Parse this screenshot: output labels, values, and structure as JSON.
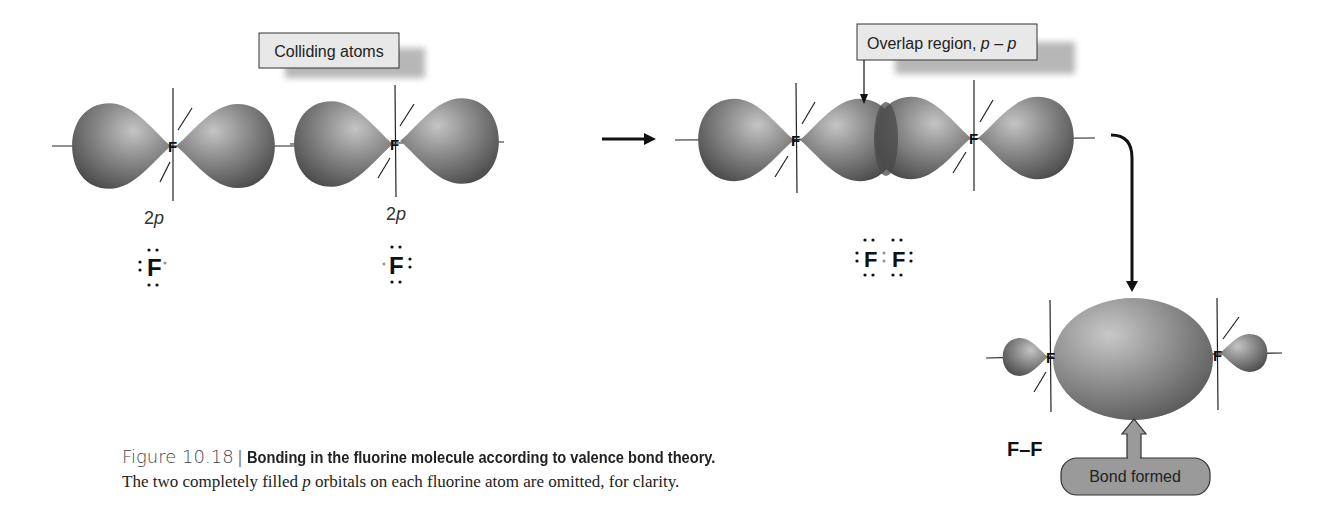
{
  "figure": {
    "number": "Figure 10.18",
    "title": "Bonding in the fluorine molecule according to valence bond theory.",
    "caption_pre": "The two completely filled ",
    "caption_italic": "p",
    "caption_post": " orbitals on each fluorine atom are omitted, for clarity."
  },
  "labels": {
    "colliding_atoms": "Colliding atoms",
    "overlap_region": "Overlap region, ",
    "overlap_italic": "p – p",
    "bond_formed": "Bond formed",
    "orbital_left": "2",
    "orbital_left_italic": "p",
    "orbital_right": "2",
    "orbital_right_italic": "p",
    "plus": "+",
    "atom_symbol": "F",
    "molecule_formula": "F–F"
  },
  "colors": {
    "lobe_dark": "#5a5a5a",
    "lobe_light": "#b8b8b8",
    "callout_fill": "#e6e6e6",
    "bond_pill_fill": "#9a9a9a",
    "line": "#222222"
  }
}
